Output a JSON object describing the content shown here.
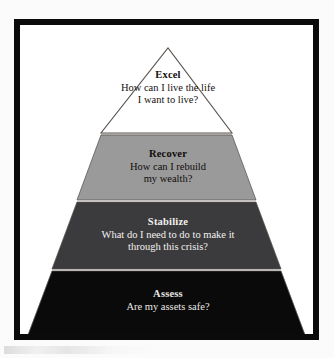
{
  "diagram": {
    "type": "pyramid",
    "orientation": "apex-up",
    "tier_count": 4,
    "frame": {
      "border_color": "#0b0b0b",
      "background_color": "#ffffff"
    },
    "tiers": [
      {
        "level": 1,
        "position": "top",
        "title": "Excel",
        "question_line_1": "How can I live the life",
        "question_line_2": "I want to live?",
        "fill_color": "#ffffff",
        "text_color": "#15100d",
        "outline_color": "#5a5450"
      },
      {
        "level": 2,
        "position": "upper-middle",
        "title": "Recover",
        "question_line_1": "How can I rebuild",
        "question_line_2": "my wealth?",
        "fill_color": "#9a9a9a",
        "text_color": "#100c0a",
        "outline_color": "#5a5450"
      },
      {
        "level": 3,
        "position": "lower-middle",
        "title": "Stabilize",
        "question_line_1": "What do I need to do to make it",
        "question_line_2": "through this crisis?",
        "fill_color": "#3b3b3d",
        "text_color": "#f3f1ef",
        "outline_color": "#5a5450"
      },
      {
        "level": 4,
        "position": "bottom",
        "title": "Assess",
        "question_line_1": "Are my assets safe?",
        "question_line_2": "",
        "fill_color": "#0a0a0a",
        "text_color": "#e9e7e4",
        "outline_color": "#5a5450"
      }
    ],
    "separator_color": "#b9b6b2"
  }
}
